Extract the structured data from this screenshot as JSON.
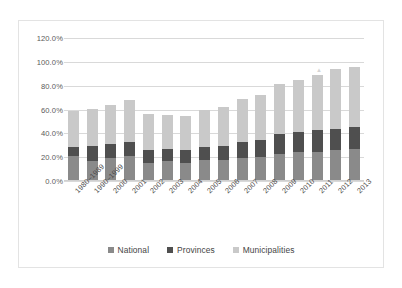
{
  "chart_data": {
    "type": "bar",
    "subtype": "stacked-bar",
    "title": "",
    "xlabel": "",
    "ylabel": "",
    "ylim": [
      0,
      120
    ],
    "y_tick_values": [
      0,
      20,
      40,
      60,
      80,
      100,
      120
    ],
    "y_tick_labels": [
      "0.0%",
      "20.0%",
      "40.0%",
      "60.0%",
      "80.0%",
      "100.0%",
      "120.0%"
    ],
    "grid": true,
    "legend_position": "bottom",
    "categories": [
      "1980–1989",
      "1990–1999",
      "2000",
      "2001",
      "2002",
      "2003",
      "2004",
      "2005",
      "2006",
      "2007",
      "2008",
      "2009",
      "2010",
      "2011",
      "2012",
      "2013"
    ],
    "series": [
      {
        "name": "National",
        "color": "#8a8a8a",
        "values": [
          21.0,
          17.0,
          19.5,
          21.0,
          15.0,
          16.5,
          15.5,
          17.5,
          17.5,
          19.5,
          20.5,
          23.0,
          24.0,
          24.5,
          26.0,
          27.0
        ]
      },
      {
        "name": "Provinces",
        "color": "#4f4f4f",
        "values": [
          7.5,
          12.0,
          11.5,
          12.0,
          11.0,
          10.5,
          10.5,
          11.0,
          12.0,
          13.0,
          14.0,
          16.5,
          17.0,
          18.0,
          18.0,
          18.5
        ]
      },
      {
        "name": "Municipalities",
        "color": "#c9c9c9",
        "values": [
          30.5,
          31.5,
          33.0,
          35.0,
          30.0,
          28.5,
          28.5,
          31.5,
          32.5,
          36.5,
          38.0,
          42.0,
          43.5,
          46.5,
          50.0,
          50.0
        ]
      }
    ],
    "totals": [
      59.0,
      60.5,
      64.0,
      68.0,
      56.0,
      55.5,
      54.5,
      60.0,
      62.0,
      69.0,
      72.5,
      81.5,
      84.5,
      89.0,
      94.0,
      95.5
    ]
  },
  "legend": {
    "items": [
      {
        "label": "National",
        "color": "#8a8a8a"
      },
      {
        "label": "Provinces",
        "color": "#4f4f4f"
      },
      {
        "label": "Municipalities",
        "color": "#c9c9c9"
      }
    ]
  }
}
